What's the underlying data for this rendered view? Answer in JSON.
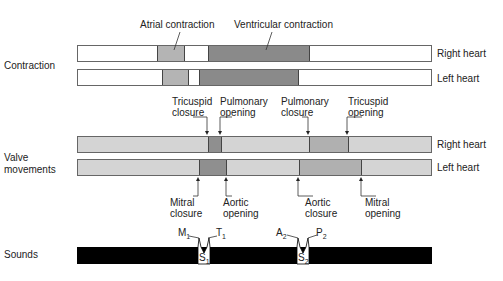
{
  "rows": {
    "contraction": "Contraction",
    "valve_movements_line1": "Valve",
    "valve_movements_line2": "movements",
    "sounds": "Sounds"
  },
  "sides": {
    "right": "Right heart",
    "left": "Left heart"
  },
  "annotations": {
    "atrial": "Atrial contraction",
    "ventricular": "Ventricular contraction",
    "tricuspid_closure": [
      "Tricuspid",
      "closure"
    ],
    "pulmonary_opening": [
      "Pulmonary",
      "opening"
    ],
    "pulmonary_closure": [
      "Pulmonary",
      "closure"
    ],
    "tricuspid_opening": [
      "Tricuspid",
      "opening"
    ],
    "mitral_closure": [
      "Mitral",
      "closure"
    ],
    "aortic_opening": [
      "Aortic",
      "opening"
    ],
    "aortic_closure": [
      "Aortic",
      "closure"
    ],
    "mitral_opening": [
      "Mitral",
      "opening"
    ]
  },
  "sounds": {
    "m": "M",
    "t": "T",
    "a": "A",
    "p": "P",
    "s": "S",
    "one": "1",
    "two": "2"
  },
  "colors": {
    "light": "#d4d4d4",
    "atrial": "#b4b4b4",
    "ventricular": "#8a8a8a",
    "valve_dark": "#8f8f8f",
    "valve_mid": "#b0b0b0",
    "sound": "#000000"
  }
}
